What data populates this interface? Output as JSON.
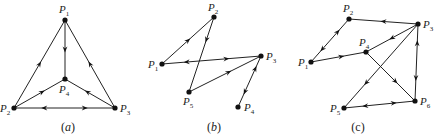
{
  "figure": {
    "background": "#ffffff",
    "ink": "#222222",
    "graphs": [
      {
        "id": "a",
        "caption": "(a)",
        "caption_letter": "a",
        "caption_pos": [
          68,
          131
        ],
        "caption_italic": true,
        "nodes": [
          {
            "id": "P1",
            "name": "P",
            "sub": "1",
            "x": 65,
            "y": 20,
            "lx": 59,
            "ly": 13
          },
          {
            "id": "P2",
            "name": "P",
            "sub": "2",
            "x": 14,
            "y": 108,
            "lx": 0,
            "ly": 112
          },
          {
            "id": "P3",
            "name": "P",
            "sub": "3",
            "x": 115,
            "y": 108,
            "lx": 120,
            "ly": 112
          },
          {
            "id": "P4",
            "name": "P",
            "sub": "4",
            "x": 65,
            "y": 79,
            "lx": 59,
            "ly": 93
          }
        ],
        "edges": [
          {
            "from": "P1",
            "to": "P4",
            "arrows": [
              {
                "t": 0.5,
                "dir": 1
              }
            ]
          },
          {
            "from": "P2",
            "to": "P1",
            "arrows": [
              {
                "t": 0.5,
                "dir": 1
              }
            ]
          },
          {
            "from": "P3",
            "to": "P1",
            "arrows": [
              {
                "t": 0.5,
                "dir": 1
              }
            ]
          },
          {
            "from": "P2",
            "to": "P4",
            "arrows": [
              {
                "t": 0.55,
                "dir": 1
              }
            ]
          },
          {
            "from": "P3",
            "to": "P4",
            "arrows": [
              {
                "t": 0.55,
                "dir": 1
              }
            ]
          },
          {
            "from": "P2",
            "to": "P3",
            "arrows": [
              {
                "t": 0.3,
                "dir": -1
              },
              {
                "t": 0.7,
                "dir": 1
              }
            ]
          }
        ]
      },
      {
        "id": "b",
        "caption": "(b)",
        "caption_letter": "b",
        "caption_pos": [
          214,
          131
        ],
        "caption_italic": true,
        "nodes": [
          {
            "id": "P1",
            "name": "P",
            "sub": "1",
            "x": 162,
            "y": 64,
            "lx": 148,
            "ly": 68
          },
          {
            "id": "P2",
            "name": "P",
            "sub": "2",
            "x": 214,
            "y": 17,
            "lx": 208,
            "ly": 11
          },
          {
            "id": "P3",
            "name": "P",
            "sub": "3",
            "x": 261,
            "y": 56,
            "lx": 266,
            "ly": 60
          },
          {
            "id": "P4",
            "name": "P",
            "sub": "4",
            "x": 238,
            "y": 107,
            "lx": 244,
            "ly": 111
          },
          {
            "id": "P5",
            "name": "P",
            "sub": "5",
            "x": 189,
            "y": 92,
            "lx": 183,
            "ly": 105
          }
        ],
        "edges": [
          {
            "from": "P1",
            "to": "P2",
            "arrows": [
              {
                "t": 0.5,
                "dir": 1
              }
            ]
          },
          {
            "from": "P2",
            "to": "P5",
            "arrows": [
              {
                "t": 0.3,
                "dir": 1
              }
            ]
          },
          {
            "from": "P5",
            "to": "P3",
            "arrows": [
              {
                "t": 0.55,
                "dir": 1
              }
            ]
          },
          {
            "from": "P1",
            "to": "P3",
            "arrows": [
              {
                "t": 0.25,
                "dir": -1
              },
              {
                "t": 0.65,
                "dir": 1
              }
            ]
          },
          {
            "from": "P3",
            "to": "P4",
            "arrows": [
              {
                "t": 0.25,
                "dir": -1
              },
              {
                "t": 0.7,
                "dir": 1
              }
            ]
          }
        ]
      },
      {
        "id": "c",
        "caption": "(c)",
        "caption_letter": "c",
        "caption_pos": [
          358,
          131
        ],
        "caption_italic": false,
        "nodes": [
          {
            "id": "P1",
            "name": "P",
            "sub": "1",
            "x": 311,
            "y": 62,
            "lx": 298,
            "ly": 66
          },
          {
            "id": "P2",
            "name": "P",
            "sub": "2",
            "x": 349,
            "y": 19,
            "lx": 343,
            "ly": 12
          },
          {
            "id": "P3",
            "name": "P",
            "sub": "3",
            "x": 418,
            "y": 24,
            "lx": 423,
            "ly": 28
          },
          {
            "id": "P4",
            "name": "P",
            "sub": "4",
            "x": 366,
            "y": 52,
            "lx": 359,
            "ly": 46
          },
          {
            "id": "P5",
            "name": "P",
            "sub": "5",
            "x": 344,
            "y": 108,
            "lx": 330,
            "ly": 112
          },
          {
            "id": "P6",
            "name": "P",
            "sub": "6",
            "x": 415,
            "y": 101,
            "lx": 420,
            "ly": 105
          }
        ],
        "edges": [
          {
            "from": "P3",
            "to": "P2",
            "arrows": [
              {
                "t": 0.5,
                "dir": 1
              }
            ]
          },
          {
            "from": "P1",
            "to": "P2",
            "arrows": [
              {
                "t": 0.3,
                "dir": -1
              },
              {
                "t": 0.7,
                "dir": 1
              }
            ]
          },
          {
            "from": "P1",
            "to": "P4",
            "arrows": [
              {
                "t": 0.55,
                "dir": 1
              }
            ]
          },
          {
            "from": "P3",
            "to": "P4",
            "arrows": [
              {
                "t": 0.5,
                "dir": 1
              }
            ]
          },
          {
            "from": "P3",
            "to": "P5",
            "arrows": [
              {
                "t": 0.7,
                "dir": 1
              }
            ]
          },
          {
            "from": "P4",
            "to": "P6",
            "arrows": [
              {
                "t": 0.6,
                "dir": 1
              }
            ]
          },
          {
            "from": "P3",
            "to": "P6",
            "arrows": [
              {
                "t": 0.25,
                "dir": -1
              },
              {
                "t": 0.7,
                "dir": 1
              }
            ]
          },
          {
            "from": "P5",
            "to": "P6",
            "arrows": [
              {
                "t": 0.3,
                "dir": -1
              },
              {
                "t": 0.7,
                "dir": 1
              }
            ]
          }
        ]
      }
    ]
  }
}
